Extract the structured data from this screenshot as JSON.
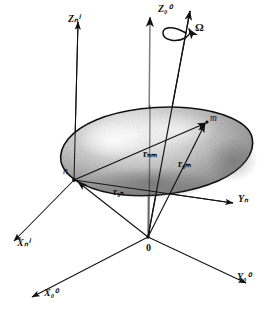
{
  "figure": {
    "background": "#ffffff",
    "ink": "#111111"
  },
  "axes": [
    {
      "name": "z-inertial-axis",
      "label_base": "Z",
      "sub": "0",
      "sup": "0",
      "display": "Z₀⁰",
      "x": 158,
      "y": 4,
      "kind": "inertial"
    },
    {
      "name": "z-body-axis",
      "label_base": "Z",
      "sub": "n",
      "sup": "i",
      "display": "Zₙⁱ",
      "x": 68,
      "y": 14,
      "kind": "body"
    },
    {
      "name": "y-body-axis",
      "label_base": "Y",
      "sub": "n",
      "sup": "",
      "display": "Yₙ",
      "x": 238,
      "y": 194,
      "kind": "body"
    },
    {
      "name": "x-body-axis",
      "label_base": "X",
      "sub": "n",
      "sup": "i",
      "display": "Xₙⁱ",
      "x": 17,
      "y": 238,
      "kind": "body"
    },
    {
      "name": "y-inertial-axis",
      "label_base": "Y",
      "sub": "0",
      "sup": "0",
      "display": "Y₀⁰",
      "x": 237,
      "y": 272,
      "kind": "inertial"
    },
    {
      "name": "x-inertial-axis",
      "label_base": "X",
      "sub": "0",
      "sup": "0",
      "display": "X₀⁰",
      "x": 44,
      "y": 288,
      "kind": "inertial"
    }
  ],
  "vectors": [
    {
      "name": "vector-r-nm",
      "symbol": "r",
      "sub": "nm",
      "display": "rₙₘ",
      "from": "n",
      "to": "m",
      "x": 143,
      "y": 150
    },
    {
      "name": "vector-r-Om",
      "symbol": "r",
      "sub": "Om",
      "display": "r₀ₘ",
      "from": "0",
      "to": "m",
      "x": 178,
      "y": 160
    },
    {
      "name": "vector-r-On",
      "symbol": "r",
      "sub": "On",
      "display": "r₀ₙ",
      "from": "0",
      "to": "n",
      "x": 113,
      "y": 188
    }
  ],
  "points": [
    {
      "name": "point-n",
      "label": "n",
      "x": 69,
      "y": 168,
      "role": "body-frame-origin"
    },
    {
      "name": "point-m",
      "label": "m",
      "x": 210,
      "y": 117,
      "role": "mass-element"
    },
    {
      "name": "point-0",
      "label": "0",
      "x": 148,
      "y": 243,
      "role": "inertial-origin"
    }
  ],
  "annotations": [
    {
      "name": "angular-velocity-omega",
      "label": "Ω",
      "x": 195,
      "y": 22,
      "meaning": "angular velocity about spin axis"
    }
  ],
  "body": {
    "name": "rigid-body",
    "shape": "irregular-ellipsoid",
    "fill_light": "#f2f2f2",
    "fill_mid": "#b8b8b8",
    "fill_dark": "#6f6f6f",
    "outline": "#111111"
  }
}
